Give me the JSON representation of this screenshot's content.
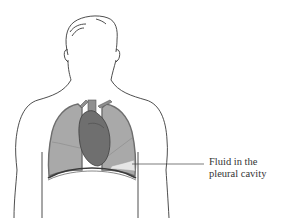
{
  "diagram": {
    "callout": {
      "line1": "Fluid in the",
      "line2": "pleural cavity"
    },
    "colors": {
      "outline": "#3a3a3a",
      "lung_fill": "#a9a9a9",
      "lung_edge": "#6e6e6e",
      "heart_fill": "#6f6f6f",
      "fluid_fill": "#e6e6e6",
      "background": "#ffffff"
    }
  }
}
